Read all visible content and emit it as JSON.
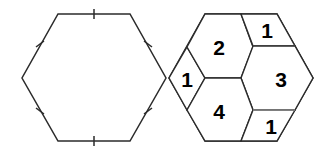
{
  "figure": {
    "colors": {
      "background": "#ffffff",
      "stroke": "#2b2b2b",
      "stroke_light": "#8a8a8a",
      "label": "#000000"
    },
    "left_hexagon": {
      "name": "plain-hexagon",
      "tick_marks": 6,
      "tick_note": "single tick on each of the six sides"
    },
    "right_hexagon": {
      "name": "dissected-hexagon",
      "piece_count": 6,
      "pieces": [
        {
          "id": "piece-left-rhombus",
          "label": "1",
          "shape": "rhombus",
          "cx": 187,
          "cy": 78
        },
        {
          "id": "piece-upper-left-hexagon",
          "label": "2",
          "shape": "hexagon",
          "cx": 219,
          "cy": 47
        },
        {
          "id": "piece-top-right-trapezoid",
          "label": "1",
          "shape": "trapezoid",
          "cx": 266,
          "cy": 30
        },
        {
          "id": "piece-right-hexagon",
          "label": "3",
          "shape": "hexagon",
          "cx": 281,
          "cy": 79
        },
        {
          "id": "piece-lower-left-hexagon",
          "label": "4",
          "shape": "hexagon",
          "cx": 219,
          "cy": 111
        },
        {
          "id": "piece-bottom-right-rhombus",
          "label": "1",
          "shape": "rhombus",
          "cx": 272,
          "cy": 126
        }
      ],
      "labels_in_reading_order": [
        "2",
        "1",
        "1",
        "3",
        "4",
        "1"
      ]
    }
  }
}
